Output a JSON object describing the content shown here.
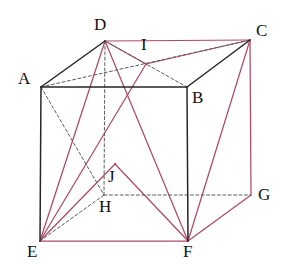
{
  "figure": {
    "kind": "geometry-diagram",
    "shape": "cube",
    "colors": {
      "edge_solid": "#262626",
      "edge_hidden": "#5d5d5d",
      "accent_red": "#b04a64",
      "background": "#ffffff",
      "label_text": "#111111"
    },
    "vertices": [
      {
        "name": "A",
        "x": 41,
        "y": 87,
        "label_x": 18,
        "label_y": 70,
        "hidden": false
      },
      {
        "name": "B",
        "x": 187,
        "y": 87,
        "label_x": 192,
        "label_y": 89,
        "hidden": false
      },
      {
        "name": "C",
        "x": 250,
        "y": 40,
        "label_x": 256,
        "label_y": 22,
        "hidden": false
      },
      {
        "name": "D",
        "x": 105,
        "y": 41,
        "label_x": 94,
        "label_y": 16,
        "hidden": false
      },
      {
        "name": "E",
        "x": 40,
        "y": 241,
        "label_x": 27,
        "label_y": 243,
        "hidden": false
      },
      {
        "name": "F",
        "x": 188,
        "y": 241,
        "label_x": 183,
        "label_y": 243,
        "hidden": false
      },
      {
        "name": "G",
        "x": 251,
        "y": 195,
        "label_x": 258,
        "label_y": 186,
        "hidden": false
      },
      {
        "name": "H",
        "x": 104,
        "y": 195,
        "label_x": 99,
        "label_y": 198,
        "hidden": true
      },
      {
        "name": "I",
        "x": 146,
        "y": 64,
        "label_x": 141,
        "label_y": 36,
        "hidden": false
      },
      {
        "name": "J",
        "x": 115,
        "y": 164,
        "label_x": 108,
        "label_y": 168,
        "hidden": false
      }
    ],
    "edges_solid": [
      {
        "from": "A",
        "to": "B"
      },
      {
        "from": "A",
        "to": "E"
      },
      {
        "from": "B",
        "to": "F"
      },
      {
        "from": "A",
        "to": "D"
      },
      {
        "from": "B",
        "to": "C"
      }
    ],
    "edges_hidden": [
      {
        "from": "A",
        "to": "H"
      },
      {
        "from": "E",
        "to": "H"
      },
      {
        "from": "H",
        "to": "G"
      },
      {
        "from": "D",
        "to": "H"
      },
      {
        "from": "A",
        "to": "C"
      },
      {
        "from": "D",
        "to": "B"
      }
    ],
    "edges_red": [
      {
        "from": "D",
        "to": "C"
      },
      {
        "from": "C",
        "to": "G"
      },
      {
        "from": "G",
        "to": "F"
      },
      {
        "from": "E",
        "to": "F"
      },
      {
        "from": "D",
        "to": "I"
      },
      {
        "from": "I",
        "to": "C"
      },
      {
        "from": "C",
        "to": "F"
      },
      {
        "from": "D",
        "to": "E"
      },
      {
        "from": "E",
        "to": "I"
      },
      {
        "from": "E",
        "to": "J"
      },
      {
        "from": "J",
        "to": "F"
      },
      {
        "from": "D",
        "to": "F"
      }
    ],
    "labels": [
      "A",
      "B",
      "C",
      "D",
      "E",
      "F",
      "G",
      "H",
      "I",
      "J"
    ]
  }
}
